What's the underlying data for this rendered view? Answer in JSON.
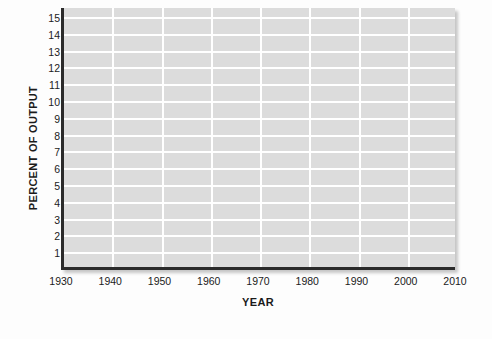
{
  "chart_data": {
    "type": "line",
    "title": "",
    "subtitle": "",
    "xlabel": "YEAR",
    "ylabel": "PERCENT OF OUTPUT",
    "xlim": [
      1930,
      2010
    ],
    "ylim": [
      0,
      15.6
    ],
    "xticks": [
      1930,
      1940,
      1950,
      1960,
      1970,
      1980,
      1990,
      2000,
      2010
    ],
    "xticklabels": [
      "1930",
      "1940",
      "1950",
      "1960",
      "1970",
      "1980",
      "1990",
      "2000",
      "2010"
    ],
    "yticks": [
      1,
      2,
      3,
      4,
      5,
      6,
      7,
      8,
      9,
      10,
      11,
      12,
      13,
      14,
      15
    ],
    "yticklabels": [
      "1",
      "2",
      "3",
      "4",
      "5",
      "6",
      "7",
      "8",
      "9",
      "10",
      "11",
      "12",
      "13",
      "14",
      "15"
    ],
    "grid": true,
    "grid_axis": "both",
    "legend": false,
    "legend_position": "none",
    "series": [],
    "annotations": [],
    "note": "Blank grid template: axes, gridlines and labels only; no data plotted.",
    "colors": {
      "plot_background": "#dcdcdc",
      "gridline": "#ffffff",
      "axis_line": "#2b2b2b",
      "text": "#1b1b1b",
      "figure_background": "#fdfdfd"
    }
  }
}
